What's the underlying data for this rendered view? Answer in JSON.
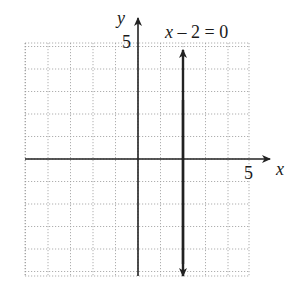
{
  "chart_data": {
    "type": "line",
    "title": "",
    "xlabel": "x",
    "ylabel": "y",
    "xlim": [
      -5,
      5
    ],
    "ylim": [
      -5,
      5
    ],
    "grid": true,
    "x_tick_label": "5",
    "y_tick_label": "5",
    "series": [
      {
        "name": "x – 2 = 0",
        "kind": "vertical-line",
        "x": 2,
        "y_range": [
          -5,
          5
        ]
      }
    ],
    "annotations": [
      {
        "text": "x – 2 = 0",
        "near": "top of vertical line"
      }
    ]
  },
  "labels": {
    "x_axis": "x",
    "y_axis": "y",
    "x_tick": "5",
    "y_tick": "5",
    "equation_x": "x",
    "equation_rest": " – 2 = 0"
  }
}
